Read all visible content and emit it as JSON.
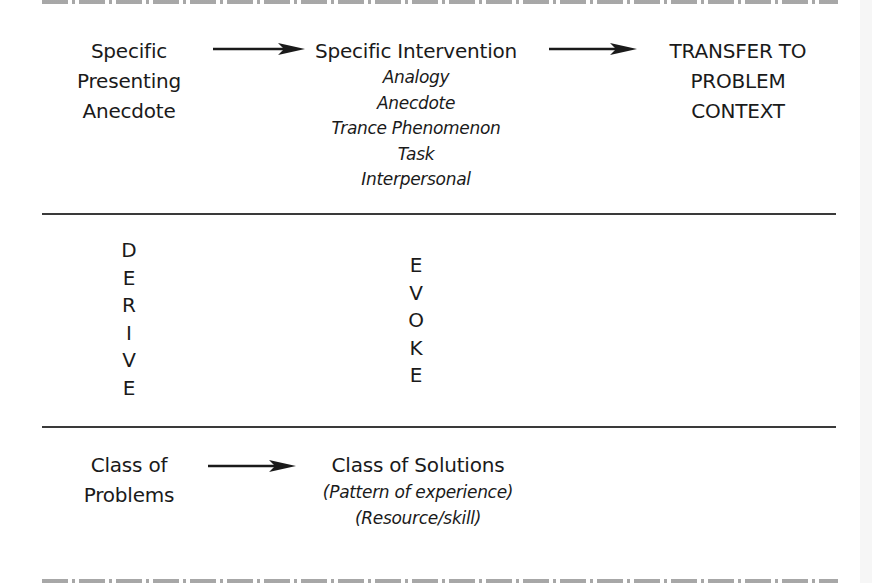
{
  "diagram": {
    "top_row": {
      "source": {
        "lines": [
          "Specific",
          "Presenting",
          "Anecdote"
        ]
      },
      "intervention": {
        "title": "Specific Intervention",
        "types": [
          "Analogy",
          "Anecdote",
          "Trance Phenomenon",
          "Task",
          "Interpersonal"
        ]
      },
      "target": {
        "lines": [
          "TRANSFER TO",
          "PROBLEM",
          "CONTEXT"
        ]
      }
    },
    "middle_row": {
      "left_vertical": {
        "word": "DERIVE",
        "letters": [
          "D",
          "E",
          "R",
          "I",
          "V",
          "E"
        ]
      },
      "center_vertical": {
        "word": "EVOKE",
        "letters": [
          "E",
          "V",
          "O",
          "K",
          "E"
        ]
      }
    },
    "bottom_row": {
      "source": {
        "lines": [
          "Class of",
          "Problems"
        ]
      },
      "solutions": {
        "title": "Class of Solutions",
        "details": [
          "(Pattern of experience)",
          "(Resource/skill)"
        ]
      }
    },
    "arrows": [
      {
        "from": "Specific Presenting Anecdote",
        "to": "Specific Intervention"
      },
      {
        "from": "Specific Intervention",
        "to": "TRANSFER TO PROBLEM CONTEXT"
      },
      {
        "from": "Class of Problems",
        "to": "Class of Solutions"
      }
    ],
    "colors": {
      "text": "#1a1a1a",
      "rules": "#3a3a3a",
      "border_pattern": "#8a8a8a"
    }
  }
}
